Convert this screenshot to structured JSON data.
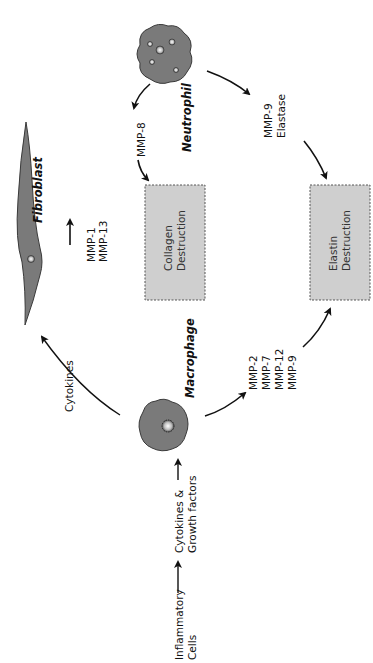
{
  "diagram": {
    "orientation": "rotated-90-ccw",
    "cells": {
      "neutrophil": {
        "label": "Neutrophil"
      },
      "fibroblast": {
        "label": "Fibroblast"
      },
      "macrophage": {
        "label": "Macrophage"
      }
    },
    "boxes": {
      "collagen": {
        "line1": "Collagen",
        "line2": "Destruction"
      },
      "elastin": {
        "line1": "Elastin",
        "line2": "Destruction"
      }
    },
    "labels": {
      "inflammatory": {
        "line1": "Inflammatory",
        "line2": "Cells"
      },
      "cytokines_growth": {
        "line1": "Cytokines &",
        "line2": "Growth factors"
      },
      "cytokines": "Cytokines",
      "fibroblast_mmps": [
        "MMP-1",
        "MMP-13"
      ],
      "neutrophil_to_collagen": [
        "MMP-8"
      ],
      "neutrophil_to_elastin": [
        "MMP-9",
        "Elastase"
      ],
      "macrophage_to_elastin": [
        "MMP-2",
        "MMP-7",
        "MMP-12",
        "MMP-9"
      ]
    },
    "colors": {
      "cell_fill": "#7a7a7a",
      "cell_stroke": "#3a3a3a",
      "box_fill": "#cfcfcf",
      "box_stroke": "#555555",
      "arrow": "#111111"
    }
  }
}
